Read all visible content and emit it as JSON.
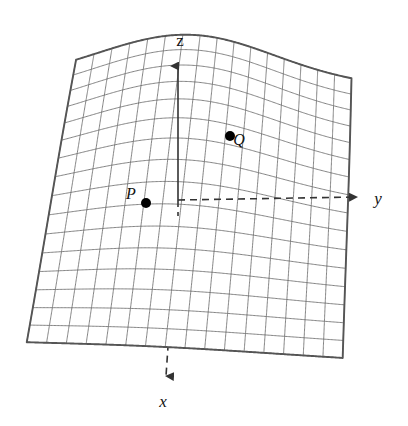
{
  "figure": {
    "type": "3d-surface-plot",
    "background_color": "#ffffff",
    "surface": {
      "border_color": "#555555",
      "grid_color": "#6e6e6e",
      "fill_color": "#ffffff",
      "grid_columns": 16,
      "grid_rows": 16,
      "corners": {
        "top_left": [
          73,
          88
        ],
        "top_right": [
          350,
          92
        ],
        "bottom_right": [
          343,
          355
        ],
        "bottom_left": [
          27,
          340
        ]
      }
    },
    "axes": [
      {
        "name": "z-axis",
        "label": "z",
        "label_x": 180,
        "label_y": 46,
        "style": "solid-above-surface dashed-below-surface",
        "arrow": "up",
        "color": "#444444"
      },
      {
        "name": "y-axis",
        "label": "y",
        "label_x": 378,
        "label_y": 204,
        "style": "dashed",
        "arrow": "right",
        "color": "#444444"
      },
      {
        "name": "x-axis",
        "label": "x",
        "label_x": 163,
        "label_y": 407,
        "style": "dashed",
        "arrow": "down",
        "color": "#444444"
      }
    ],
    "origin": [
      178,
      200
    ],
    "points": [
      {
        "name": "P",
        "label": "P",
        "dot_x": 146,
        "dot_y": 203,
        "label_x": 131,
        "label_y": 199,
        "radius": 5,
        "color": "#000000"
      },
      {
        "name": "Q",
        "label": "Q",
        "dot_x": 230,
        "dot_y": 136,
        "label_x": 239,
        "label_y": 145,
        "radius": 5,
        "color": "#000000"
      }
    ]
  },
  "chart_data": {
    "type": "surface",
    "title": "",
    "xlabel": "x",
    "ylabel": "y",
    "zlabel": "z",
    "grid": true,
    "legend": null,
    "annotations": [
      "P",
      "Q",
      "x",
      "y",
      "z"
    ],
    "surface_shape": "saddle / ridge with a central hump rising toward the z-axis",
    "mesh_u_lines": 17,
    "mesh_v_lines": 17,
    "marked_points": [
      {
        "label": "P",
        "position_note": "on the surface, left of and slightly below the origin"
      },
      {
        "label": "Q",
        "position_note": "on the surface, upper right of the origin near the crest"
      }
    ]
  }
}
